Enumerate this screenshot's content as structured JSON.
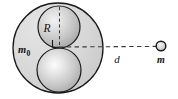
{
  "figure": {
    "background_color": "#ffffff",
    "outline_color": "#1a1a1a",
    "shell_fill_color": "#d6d6d6",
    "sphere_fill_light": "#fbfbfb",
    "sphere_fill_mid": "#d0d0d0",
    "sphere_fill_dark": "#9a9a9a",
    "dash_color": "#3a3a3a",
    "labels": {
      "radius": "R",
      "shell_mass": "m",
      "shell_mass_subscript": "0",
      "distance": "d",
      "point_mass": "m"
    },
    "geometry": {
      "shell_center_x": 58,
      "shell_center_y": 48,
      "shell_radius": 45,
      "upper_sphere_center_x": 59,
      "upper_sphere_center_y": 27,
      "upper_sphere_radius": 21,
      "lower_sphere_center_x": 59,
      "lower_sphere_center_y": 70,
      "lower_sphere_radius": 22,
      "point_mass_x": 161,
      "point_mass_y": 46,
      "point_mass_radius": 5,
      "axis_y": 47,
      "radius_line_x": 59,
      "radius_line_top_y": 7,
      "radius_line_bottom_y": 47
    }
  }
}
